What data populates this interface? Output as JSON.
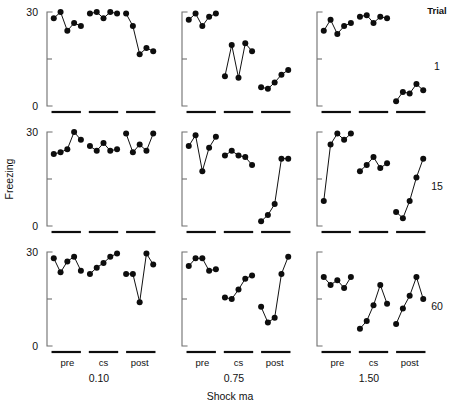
{
  "figure": {
    "y_axis_title": "Freezing",
    "x_axis_title": "Shock ma",
    "trial_header": "Trial",
    "y_ticks": [
      "0",
      "30"
    ],
    "phase_labels": [
      "pre",
      "cs",
      "post"
    ],
    "column_labels": [
      "0.10",
      "0.75",
      "1.50"
    ],
    "row_labels": [
      "1",
      "15",
      "60"
    ]
  },
  "chart_data": {
    "type": "line",
    "xlabel": "Shock ma",
    "ylabel": "Freezing",
    "ylim": [
      0,
      30
    ],
    "yticks": [
      0,
      15,
      30
    ],
    "ytick_labels": [
      "0",
      "",
      "30"
    ],
    "grid": false,
    "legend": false,
    "layout": {
      "rows": 3,
      "cols": 3,
      "row_variable": "Trial",
      "col_variable": "Shock ma",
      "row_values": [
        "1",
        "15",
        "60"
      ],
      "col_values": [
        "0.10",
        "0.75",
        "1.50"
      ],
      "phases": [
        "pre",
        "cs",
        "post"
      ],
      "points_per_phase": 5
    },
    "panels": [
      {
        "row": 0,
        "col": 0,
        "trial": "1",
        "shock_ma": "0.10",
        "phases": {
          "pre": [
            28.0,
            30.0,
            24.0,
            26.5,
            25.5
          ],
          "cs": [
            29.5,
            30.0,
            28.0,
            30.0,
            29.5
          ],
          "post": [
            29.5,
            25.5,
            16.5,
            18.5,
            17.5
          ]
        }
      },
      {
        "row": 0,
        "col": 1,
        "trial": "1",
        "shock_ma": "0.75",
        "phases": {
          "pre": [
            27.5,
            29.5,
            25.5,
            28.5,
            29.5
          ],
          "cs": [
            9.5,
            19.5,
            9.0,
            20.0,
            17.5
          ],
          "post": [
            6.0,
            5.5,
            7.5,
            10.0,
            11.5
          ]
        }
      },
      {
        "row": 0,
        "col": 2,
        "trial": "1",
        "shock_ma": "1.50",
        "phases": {
          "pre": [
            24.0,
            27.5,
            23.0,
            25.5,
            26.5
          ],
          "cs": [
            28.5,
            29.0,
            26.5,
            28.5,
            28.0
          ],
          "post": [
            1.5,
            4.5,
            4.0,
            7.0,
            5.0
          ]
        }
      },
      {
        "row": 1,
        "col": 0,
        "trial": "15",
        "shock_ma": "0.10",
        "phases": {
          "pre": [
            23.0,
            23.5,
            24.5,
            30.0,
            27.5
          ],
          "cs": [
            25.5,
            24.0,
            26.5,
            24.0,
            24.5
          ],
          "post": [
            29.5,
            23.5,
            26.0,
            24.0,
            29.5
          ]
        }
      },
      {
        "row": 1,
        "col": 1,
        "trial": "15",
        "shock_ma": "0.75",
        "phases": {
          "pre": [
            25.5,
            29.0,
            17.5,
            25.0,
            28.5
          ],
          "cs": [
            22.5,
            24.0,
            22.5,
            22.0,
            19.5
          ],
          "post": [
            1.5,
            3.5,
            7.0,
            21.5,
            21.5
          ]
        }
      },
      {
        "row": 1,
        "col": 2,
        "trial": "15",
        "shock_ma": "1.50",
        "phases": {
          "pre": [
            8.0,
            26.0,
            29.5,
            27.5,
            29.5
          ],
          "cs": [
            17.5,
            19.5,
            22.0,
            18.5,
            20.0
          ],
          "post": [
            4.5,
            2.5,
            8.0,
            15.5,
            21.5
          ]
        }
      },
      {
        "row": 2,
        "col": 0,
        "trial": "60",
        "shock_ma": "0.10",
        "phases": {
          "pre": [
            28.0,
            23.5,
            27.0,
            28.5,
            24.0
          ],
          "cs": [
            23.0,
            25.0,
            26.5,
            28.5,
            29.5
          ],
          "post": [
            23.0,
            23.0,
            14.0,
            29.5,
            26.0
          ]
        }
      },
      {
        "row": 2,
        "col": 1,
        "trial": "60",
        "shock_ma": "0.75",
        "phases": {
          "pre": [
            25.5,
            28.0,
            28.0,
            24.0,
            24.5
          ],
          "cs": [
            15.5,
            15.0,
            18.0,
            21.5,
            22.5
          ],
          "post": [
            12.5,
            7.5,
            9.0,
            23.0,
            28.5
          ]
        }
      },
      {
        "row": 2,
        "col": 2,
        "trial": "60",
        "shock_ma": "1.50",
        "phases": {
          "pre": [
            22.0,
            19.5,
            21.0,
            18.5,
            22.0
          ],
          "cs": [
            5.5,
            8.0,
            13.0,
            19.5,
            13.5
          ],
          "post": [
            7.0,
            12.0,
            16.0,
            22.0,
            15.0
          ]
        }
      }
    ]
  }
}
